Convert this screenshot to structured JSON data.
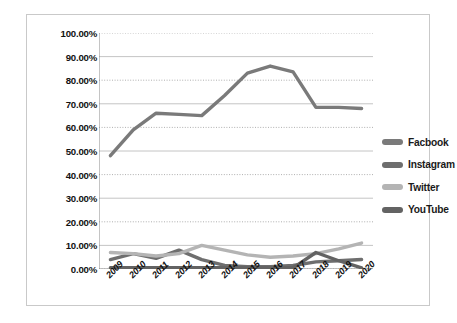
{
  "chart_data": {
    "type": "line",
    "title": "",
    "subtitle": "",
    "xlabel": "",
    "ylabel": "",
    "categories": [
      "2009",
      "2010",
      "2011",
      "2012",
      "2013",
      "2014",
      "2015",
      "2016",
      "2017",
      "2018",
      "2019",
      "2020"
    ],
    "ylim": [
      0,
      100
    ],
    "ytick_values": [
      0,
      10,
      20,
      30,
      40,
      50,
      60,
      70,
      80,
      90,
      100
    ],
    "ytick_labels": [
      "0.00%",
      "10.00%",
      "20.00%",
      "30.00%",
      "40.00%",
      "50.00%",
      "60.00%",
      "70.00%",
      "80.00%",
      "90.00%",
      "100.00%"
    ],
    "grid": true,
    "grid_style": "alternating solid and dotted horizontal gridlines",
    "legend_position": "right",
    "series": [
      {
        "name": "Facbook",
        "color": "#7a7a7a",
        "values": [
          48.0,
          59.0,
          66.0,
          65.5,
          65.0,
          73.5,
          83.0,
          86.0,
          83.5,
          68.5,
          68.5,
          68.0
        ]
      },
      {
        "name": "Instagram",
        "color": "#6e6e6e",
        "values": [
          4.0,
          6.5,
          4.5,
          8.0,
          4.0,
          1.5,
          1.0,
          1.0,
          1.5,
          3.0,
          3.5,
          4.0
        ]
      },
      {
        "name": "Twitter",
        "color": "#b4b4b4",
        "values": [
          7.0,
          6.5,
          5.5,
          6.5,
          10.0,
          8.0,
          6.0,
          5.0,
          5.5,
          6.5,
          8.5,
          11.0
        ]
      },
      {
        "name": "YouTube",
        "color": "#636363",
        "values": [
          0.5,
          0.5,
          0.5,
          0.5,
          0.5,
          0.5,
          0.5,
          0.5,
          0.5,
          7.0,
          3.5,
          0.5
        ]
      }
    ]
  },
  "legend": {
    "items": [
      {
        "label": "Facbook",
        "swatch": "#7a7a7a"
      },
      {
        "label": "Instagram",
        "swatch": "#6e6e6e"
      },
      {
        "label": "Twitter",
        "swatch": "#b4b4b4"
      },
      {
        "label": "YouTube",
        "swatch": "#636363"
      }
    ]
  },
  "caption": ""
}
